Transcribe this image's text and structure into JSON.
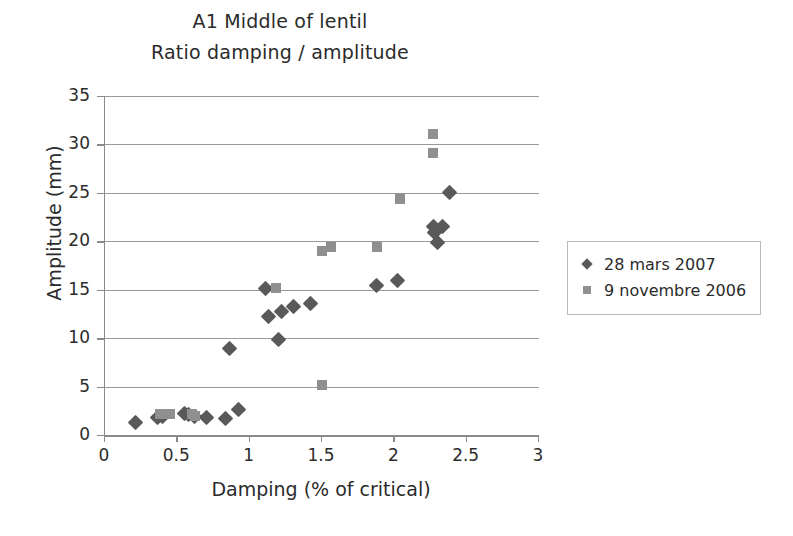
{
  "chart_data": {
    "type": "scatter",
    "title": "A1 Middle of lentil",
    "subtitle": "Ratio damping / amplitude",
    "xlabel": "Damping (% of critical)",
    "ylabel": "Amplitude (mm)",
    "xlim": [
      0,
      3
    ],
    "ylim": [
      0,
      35
    ],
    "xticks": [
      "0",
      "0.5",
      "1",
      "1.5",
      "2",
      "2.5",
      "3"
    ],
    "xtick_values": [
      0,
      0.5,
      1,
      1.5,
      2,
      2.5,
      3
    ],
    "yticks": [
      "0",
      "5",
      "10",
      "15",
      "20",
      "25",
      "30",
      "35"
    ],
    "ytick_values": [
      0,
      5,
      10,
      15,
      20,
      25,
      30,
      35
    ],
    "grid": "horizontal",
    "legend_position": "right",
    "series": [
      {
        "name": "28 mars 2007",
        "marker": "diamond",
        "color": "#595959",
        "points": [
          [
            0.21,
            1.3
          ],
          [
            0.36,
            1.8
          ],
          [
            0.4,
            1.9
          ],
          [
            0.55,
            2.2
          ],
          [
            0.58,
            2.1
          ],
          [
            0.62,
            1.9
          ],
          [
            0.7,
            1.8
          ],
          [
            0.83,
            1.7
          ],
          [
            0.92,
            2.6
          ],
          [
            0.86,
            8.9
          ],
          [
            1.11,
            15.1
          ],
          [
            1.13,
            12.2
          ],
          [
            1.2,
            9.9
          ],
          [
            1.22,
            12.8
          ],
          [
            1.3,
            13.3
          ],
          [
            1.42,
            13.6
          ],
          [
            1.88,
            15.4
          ],
          [
            2.02,
            15.9
          ],
          [
            2.27,
            21.5
          ],
          [
            2.28,
            20.9
          ],
          [
            2.33,
            21.5
          ],
          [
            2.3,
            19.9
          ],
          [
            2.38,
            25.0
          ]
        ]
      },
      {
        "name": "9 novembre 2006",
        "marker": "square",
        "color": "#8f8f8f",
        "points": [
          [
            0.38,
            2.2
          ],
          [
            0.45,
            2.2
          ],
          [
            0.6,
            2.2
          ],
          [
            0.62,
            2.0
          ],
          [
            1.18,
            15.2
          ],
          [
            1.5,
            5.2
          ],
          [
            1.5,
            19.0
          ],
          [
            1.56,
            19.4
          ],
          [
            1.88,
            19.4
          ],
          [
            2.04,
            24.4
          ],
          [
            2.27,
            31.1
          ],
          [
            2.27,
            29.1
          ]
        ]
      }
    ]
  },
  "legend": {
    "entries": [
      {
        "label": "28 mars 2007"
      },
      {
        "label": "9 novembre 2006"
      }
    ]
  },
  "colors": {
    "series_1": "#595959",
    "series_2": "#8f8f8f",
    "axis": "#8a8a8a",
    "grid": "#9a9a9a",
    "text": "#2b2b2b",
    "background": "#ffffff"
  }
}
